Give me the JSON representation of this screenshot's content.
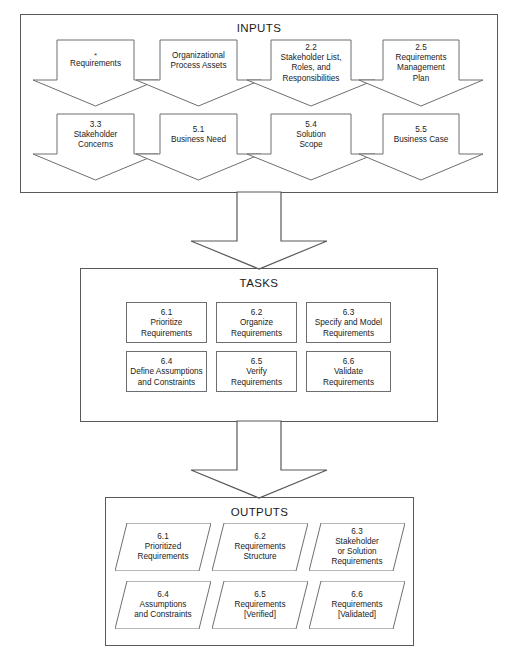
{
  "diagram": {
    "type": "process-flow",
    "sections": [
      {
        "id": "inputs",
        "title": "INPUTS",
        "shape": "down-arrow-callout",
        "rows": [
          [
            {
              "number": "",
              "marker": "*",
              "lines": [
                "Requirements"
              ]
            },
            {
              "number": "",
              "marker": "",
              "lines": [
                "Organizational",
                "Process Assets"
              ]
            },
            {
              "number": "2.2",
              "marker": "",
              "lines": [
                "Stakeholder List,",
                "Roles, and",
                "Responsibilities"
              ]
            },
            {
              "number": "2.5",
              "marker": "",
              "lines": [
                "Requirements",
                "Management",
                "Plan"
              ]
            }
          ],
          [
            {
              "number": "3.3",
              "marker": "",
              "lines": [
                "Stakeholder",
                "Concerns"
              ]
            },
            {
              "number": "5.1",
              "marker": "",
              "lines": [
                "Business Need"
              ]
            },
            {
              "number": "5.4",
              "marker": "",
              "lines": [
                "Solution",
                "Scope"
              ]
            },
            {
              "number": "5.5",
              "marker": "",
              "lines": [
                "Business Case"
              ]
            }
          ]
        ]
      },
      {
        "id": "tasks",
        "title": "TASKS",
        "shape": "rectangle",
        "rows": [
          [
            {
              "number": "6.1",
              "marker": "",
              "lines": [
                "Prioritize",
                "Requirements"
              ]
            },
            {
              "number": "6.2",
              "marker": "",
              "lines": [
                "Organize",
                "Requirements"
              ]
            },
            {
              "number": "6.3",
              "marker": "",
              "lines": [
                "Specify and Model",
                "Requirements"
              ]
            }
          ],
          [
            {
              "number": "6.4",
              "marker": "",
              "lines": [
                "Define Assumptions",
                "and Constraints"
              ]
            },
            {
              "number": "6.5",
              "marker": "",
              "lines": [
                "Verify",
                "Requirements"
              ]
            },
            {
              "number": "6.6",
              "marker": "",
              "lines": [
                "Validate",
                "Requirements"
              ]
            }
          ]
        ]
      },
      {
        "id": "outputs",
        "title": "OUTPUTS",
        "shape": "parallelogram",
        "rows": [
          [
            {
              "number": "6.1",
              "marker": "",
              "lines": [
                "Prioritized",
                "Requirements"
              ]
            },
            {
              "number": "6.2",
              "marker": "",
              "lines": [
                "Requirements",
                "Structure"
              ]
            },
            {
              "number": "6.3",
              "marker": "",
              "lines": [
                "Stakeholder",
                "or Solution",
                "Requirements"
              ]
            }
          ],
          [
            {
              "number": "6.4",
              "marker": "",
              "lines": [
                "Assumptions",
                "and Constraints"
              ]
            },
            {
              "number": "6.5",
              "marker": "",
              "lines": [
                "Requirements",
                "[Verified]"
              ]
            },
            {
              "number": "6.6",
              "marker": "",
              "lines": [
                "Requirements",
                "[Validated]"
              ]
            }
          ]
        ]
      }
    ],
    "connectors": [
      {
        "id": "inputs-to-tasks",
        "direction": "down",
        "from": "inputs",
        "to": "tasks"
      },
      {
        "id": "tasks-to-outputs",
        "direction": "down",
        "from": "tasks",
        "to": "outputs"
      }
    ],
    "colors": {
      "panel_border": "#58595b",
      "shape_border": "#6d6e71",
      "text": "#1a1a1a",
      "background": "#ffffff"
    }
  }
}
